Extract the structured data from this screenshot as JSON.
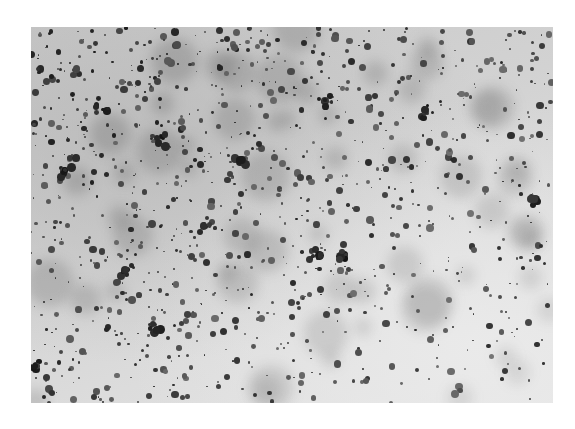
{
  "image": {
    "description": "Grayscale micrograph of dark stained round particles/cells scattered over a light gray background, denser toward upper-left",
    "frame": {
      "x": 31,
      "y": 27,
      "width": 522,
      "height": 376
    },
    "colors": {
      "page_background": "#ffffff",
      "field_dark": "#c9c9c9",
      "field_light": "#e4e4e4",
      "particle_dark": "#1a1a1a",
      "particle_mid": "#555555"
    },
    "particle_field": {
      "seed": 1337,
      "count": 1100,
      "haze_count": 60,
      "size_range_px": [
        1.5,
        8
      ],
      "density_gradient": "upper-left dense, lower-right sparse"
    },
    "clusters": [
      {
        "x": 100,
        "y": 105,
        "r": 10
      },
      {
        "x": 160,
        "y": 140,
        "r": 9
      },
      {
        "x": 240,
        "y": 160,
        "r": 8
      },
      {
        "x": 65,
        "y": 170,
        "r": 9
      },
      {
        "x": 205,
        "y": 225,
        "r": 9
      },
      {
        "x": 325,
        "y": 100,
        "r": 8
      },
      {
        "x": 425,
        "y": 110,
        "r": 10
      },
      {
        "x": 315,
        "y": 255,
        "r": 8
      },
      {
        "x": 345,
        "y": 255,
        "r": 7
      },
      {
        "x": 125,
        "y": 270,
        "r": 8
      },
      {
        "x": 155,
        "y": 330,
        "r": 7
      },
      {
        "x": 35,
        "y": 365,
        "r": 6
      },
      {
        "x": 535,
        "y": 200,
        "r": 6
      }
    ]
  }
}
